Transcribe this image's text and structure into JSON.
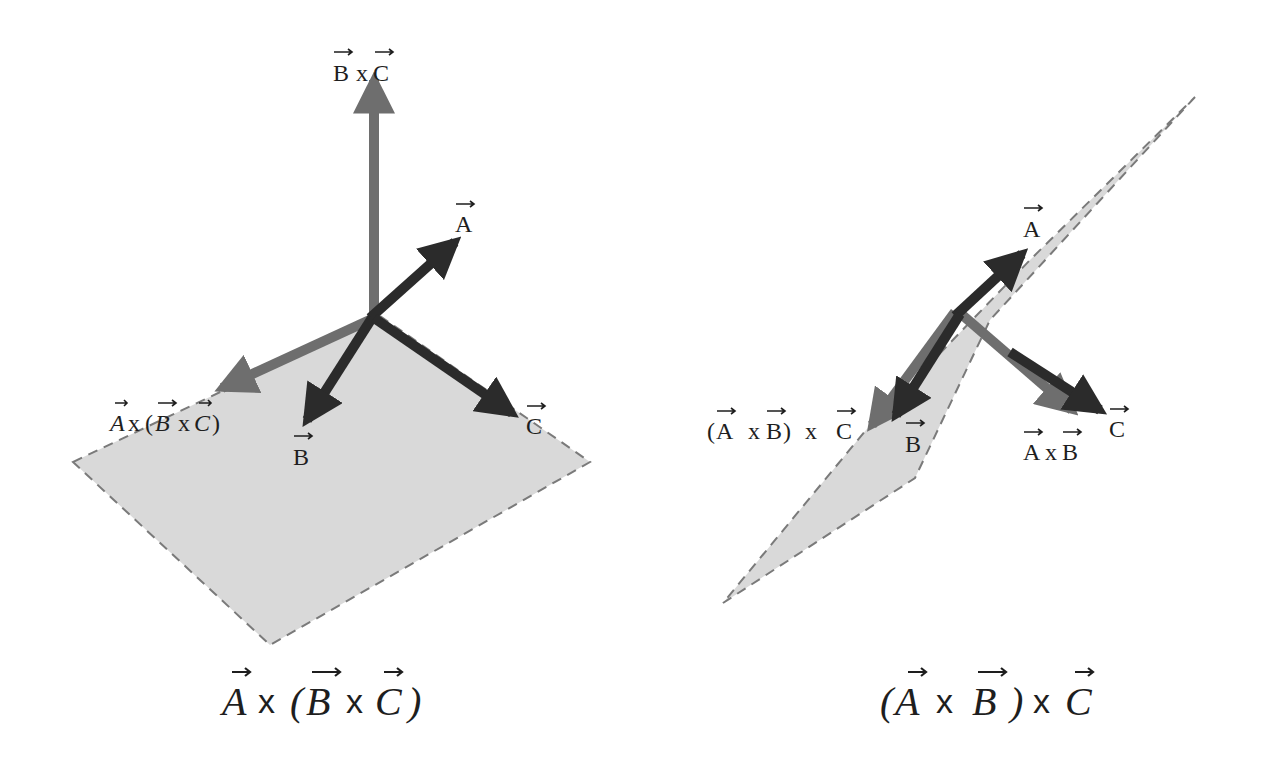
{
  "colors": {
    "background": "#ffffff",
    "plane_fill": "#d9d9d9",
    "plane_stroke": "#7a7a7a",
    "dark_arrow": "#2b2b2b",
    "mid_arrow": "#6e6e6e",
    "text": "#1e1e1e"
  },
  "left_diagram": {
    "caption": {
      "a": "A",
      "x1": "x",
      "open": "(",
      "b": "B",
      "x2": "x",
      "c": "C",
      "close": ")"
    },
    "labels": {
      "bxc": {
        "b": "B",
        "x": "x",
        "c": "C"
      },
      "a": "A",
      "b": "B",
      "c": "C",
      "triple": {
        "a": "A",
        "x1": "x",
        "open": "(",
        "b": "B",
        "x2": "x",
        "c": "C",
        "close": ")"
      }
    }
  },
  "right_diagram": {
    "caption": {
      "open": "(",
      "a": "A",
      "x1": "x",
      "b": "B",
      "close": ")",
      "x2": "x",
      "c": "C"
    },
    "labels": {
      "a": "A",
      "b": "B",
      "c": "C",
      "axb": {
        "a": "A",
        "x": "x",
        "b": "B"
      },
      "triple": {
        "open": "(",
        "a": "A",
        "x1": "x",
        "b": "B",
        "close": ")",
        "x2": "x",
        "c": "C"
      }
    }
  }
}
